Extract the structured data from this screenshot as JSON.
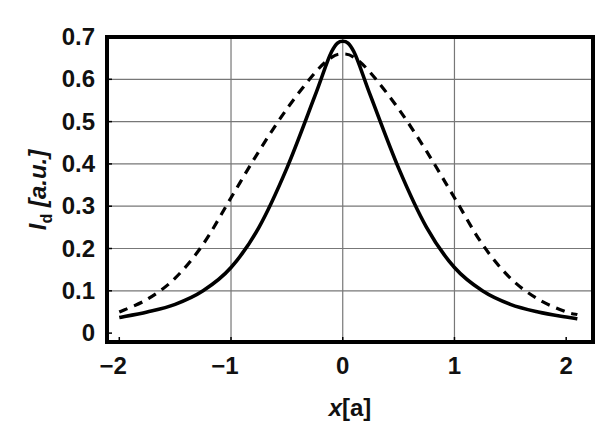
{
  "chart_data": {
    "type": "line",
    "title": "",
    "xlabel": "x[a]",
    "xlabel_main": "x",
    "xlabel_unit": "[a]",
    "ylabel": "I_d [a.u.]",
    "ylabel_main": "I",
    "ylabel_sub": "d",
    "ylabel_unit": " [a.u.]",
    "xlim": [
      -2.11,
      2.24
    ],
    "ylim": [
      -0.021,
      0.7
    ],
    "xticks": [
      -2,
      -1,
      0,
      1,
      2
    ],
    "xtick_labels": [
      "−2",
      "−1",
      "0",
      "1",
      "2"
    ],
    "yticks": [
      0,
      0.1,
      0.2,
      0.3,
      0.4,
      0.5,
      0.6,
      0.7
    ],
    "ytick_labels": [
      "0",
      "0.1",
      "0.2",
      "0.3",
      "0.4",
      "0.5",
      "0.6",
      "0.7"
    ],
    "grid": true,
    "legend": null,
    "series": [
      {
        "name": "solid",
        "style": "solid",
        "color": "#000000",
        "x": [
          -2.0,
          -1.75,
          -1.5,
          -1.25,
          -1.0,
          -0.75,
          -0.5,
          -0.25,
          -0.1,
          0.0,
          0.1,
          0.25,
          0.5,
          0.75,
          1.0,
          1.25,
          1.5,
          1.75,
          2.0,
          2.1
        ],
        "y": [
          0.037,
          0.05,
          0.068,
          0.1,
          0.155,
          0.25,
          0.39,
          0.56,
          0.665,
          0.69,
          0.665,
          0.56,
          0.39,
          0.25,
          0.155,
          0.1,
          0.068,
          0.05,
          0.038,
          0.034
        ]
      },
      {
        "name": "dashed",
        "style": "dashed",
        "color": "#000000",
        "x": [
          -2.0,
          -1.75,
          -1.5,
          -1.25,
          -1.0,
          -0.75,
          -0.5,
          -0.25,
          -0.1,
          0.0,
          0.1,
          0.25,
          0.5,
          0.75,
          1.0,
          1.25,
          1.5,
          1.75,
          2.0,
          2.1
        ],
        "y": [
          0.05,
          0.08,
          0.13,
          0.21,
          0.32,
          0.43,
          0.53,
          0.615,
          0.652,
          0.66,
          0.652,
          0.615,
          0.53,
          0.43,
          0.32,
          0.21,
          0.13,
          0.08,
          0.05,
          0.044
        ]
      }
    ]
  },
  "layout": {
    "plot_left": 107,
    "plot_right": 593,
    "plot_top": 37,
    "plot_bottom": 342
  }
}
